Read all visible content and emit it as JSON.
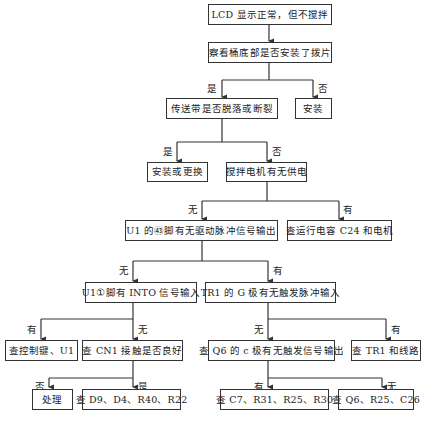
{
  "diagram": {
    "type": "flowchart",
    "caption_visible": false,
    "nodes": {
      "start": "LCD 显示正常，但不搅拌",
      "check_paddle": "察看桶底部是否安装了拨片",
      "belt_check": "传送带是否脱落或断裂",
      "install": "安装",
      "install_or_replace": "安装或更换",
      "motor_power": "搅拌电机有无供电",
      "u1_pin43": "U1 的㊸脚有无驱动脉冲信号输出",
      "check_c24": "查运行电容 C24 和电机",
      "u1_pin1": "U1①脚有 INTO 信号输入",
      "tr1_gate": "TR1 的 G 极有无触发脉冲输入",
      "check_keys": "查控制键、U1",
      "check_cn1": "查 CN1 接触是否良好",
      "check_q6": "查 Q6 的 c 极有无触发信号输出",
      "check_tr1": "查 TR1 和线路",
      "handle": "处理",
      "check_d9": "查 D9、D4、R40、R22",
      "check_c7": "查 C7、R31、R25、R30",
      "check_q6_parts": "查 Q6、R25、C26"
    },
    "edge_labels": {
      "yes": "是",
      "no": "否",
      "has": "有",
      "none": "无"
    }
  }
}
